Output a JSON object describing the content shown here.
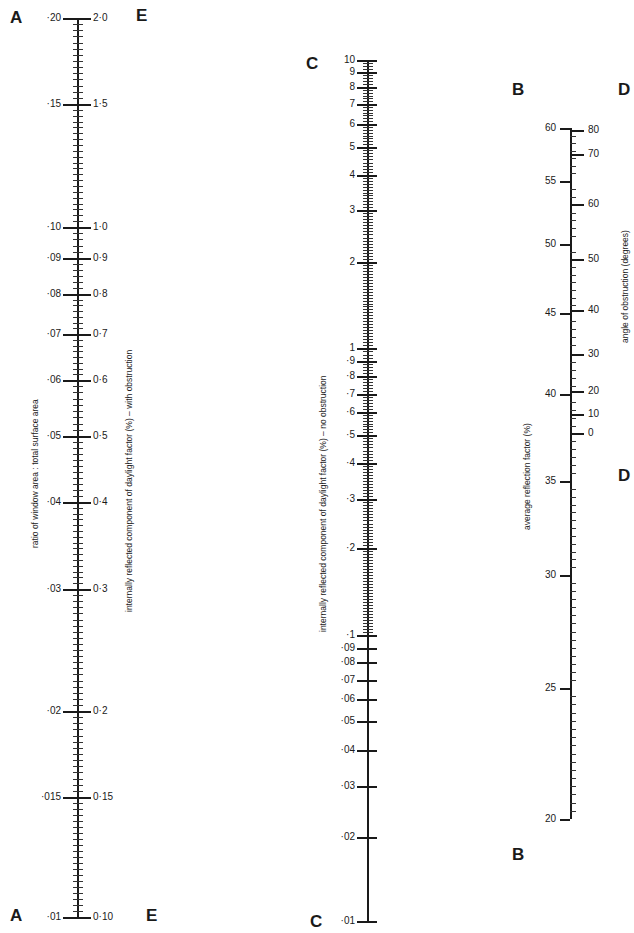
{
  "nomogram": {
    "letters": [
      {
        "id": "A-top",
        "text": "A",
        "x": 10,
        "y": 8
      },
      {
        "id": "A-bottom",
        "text": "A",
        "x": 10,
        "y": 906
      },
      {
        "id": "E-top",
        "text": "E",
        "x": 136,
        "y": 6
      },
      {
        "id": "E-bottom",
        "text": "E",
        "x": 146,
        "y": 906
      },
      {
        "id": "C-top",
        "text": "C",
        "x": 306,
        "y": 54
      },
      {
        "id": "C-bottom",
        "text": "C",
        "x": 310,
        "y": 912
      },
      {
        "id": "B-top",
        "text": "B",
        "x": 512,
        "y": 80
      },
      {
        "id": "B-bottom",
        "text": "B",
        "x": 512,
        "y": 845
      },
      {
        "id": "D-top",
        "text": "D",
        "x": 618,
        "y": 80
      },
      {
        "id": "D-bottom",
        "text": "D",
        "x": 618,
        "y": 466
      }
    ],
    "titles": {
      "a": "ratio of window area : total surface area",
      "e": "internally reflected component of daylight factor (%) – with obstruction",
      "c": "internally reflected component of daylight factor (%) – no obstruction",
      "b": "average reflection factor (%)",
      "d": "angle of obstruction (degrees)"
    },
    "scale_ae": {
      "axis_x": 77,
      "top": 18,
      "bottom": 917,
      "ticks": [
        {
          "a": "·20",
          "e": "2·0",
          "y": 18
        },
        {
          "a": "·15",
          "e": "1·5",
          "y": 104
        },
        {
          "a": "·10",
          "e": "1·0",
          "y": 227
        },
        {
          "a": "·09",
          "e": "0·9",
          "y": 258
        },
        {
          "a": "·08",
          "e": "0·8",
          "y": 294
        },
        {
          "a": "·07",
          "e": "0·7",
          "y": 334
        },
        {
          "a": "·06",
          "e": "0·6",
          "y": 380
        },
        {
          "a": "·05",
          "e": "0·5",
          "y": 436
        },
        {
          "a": "·04",
          "e": "0·4",
          "y": 502
        },
        {
          "a": "·03",
          "e": "0·3",
          "y": 589
        },
        {
          "a": "·02",
          "e": "0·2",
          "y": 711
        },
        {
          "a": "·015",
          "e": "0·15",
          "y": 797
        },
        {
          "a": "·01",
          "e": "0·10",
          "y": 917
        }
      ]
    },
    "scale_c": {
      "axis_x": 367,
      "top": 60,
      "bottom": 921,
      "ticks": [
        {
          "label": "10",
          "y": 60
        },
        {
          "label": "9",
          "y": 72
        },
        {
          "label": "8",
          "y": 87
        },
        {
          "label": "7",
          "y": 104
        },
        {
          "label": "6",
          "y": 124
        },
        {
          "label": "5",
          "y": 147
        },
        {
          "label": "4",
          "y": 175
        },
        {
          "label": "3",
          "y": 210
        },
        {
          "label": "2",
          "y": 262
        },
        {
          "label": "1",
          "y": 348
        },
        {
          "label": "·9",
          "y": 361
        },
        {
          "label": "·8",
          "y": 376
        },
        {
          "label": "·7",
          "y": 394
        },
        {
          "label": "·6",
          "y": 412
        },
        {
          "label": "·5",
          "y": 435
        },
        {
          "label": "·4",
          "y": 463
        },
        {
          "label": "·3",
          "y": 499
        },
        {
          "label": "·2",
          "y": 548
        },
        {
          "label": "·1",
          "y": 635
        },
        {
          "label": "·09",
          "y": 648
        },
        {
          "label": "·08",
          "y": 662
        },
        {
          "label": "·07",
          "y": 680
        },
        {
          "label": "·06",
          "y": 699
        },
        {
          "label": "·05",
          "y": 721
        },
        {
          "label": "·04",
          "y": 750
        },
        {
          "label": "·03",
          "y": 786
        },
        {
          "label": "·02",
          "y": 837
        },
        {
          "label": "·01",
          "y": 921
        }
      ]
    },
    "scale_b": {
      "axis_x": 570,
      "top": 128,
      "bottom": 819,
      "ticks": [
        {
          "label": "60",
          "y": 128
        },
        {
          "label": "55",
          "y": 181
        },
        {
          "label": "50",
          "y": 244
        },
        {
          "label": "45",
          "y": 313
        },
        {
          "label": "40",
          "y": 394
        },
        {
          "label": "35",
          "y": 481
        },
        {
          "label": "30",
          "y": 575
        },
        {
          "label": "25",
          "y": 688
        },
        {
          "label": "20",
          "y": 819
        }
      ]
    },
    "scale_d": {
      "ticks": [
        {
          "label": "80",
          "y": 130
        },
        {
          "label": "70",
          "y": 154
        },
        {
          "label": "60",
          "y": 204
        },
        {
          "label": "50",
          "y": 259
        },
        {
          "label": "40",
          "y": 310
        },
        {
          "label": "30",
          "y": 354
        },
        {
          "label": "20",
          "y": 391
        },
        {
          "label": "10",
          "y": 414
        },
        {
          "label": "0",
          "y": 433
        }
      ]
    }
  }
}
